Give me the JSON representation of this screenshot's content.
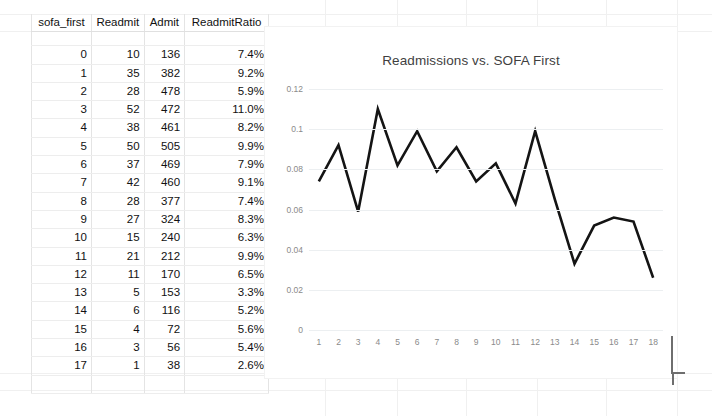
{
  "table": {
    "name": "readmissions-table",
    "columns": [
      "sofa_first",
      "Readmit",
      "Admit",
      "ReadmitRatio"
    ],
    "rows": [
      {
        "sofa_first": "0",
        "readmit": "10",
        "admit": "136",
        "ratio": "7.4%"
      },
      {
        "sofa_first": "1",
        "readmit": "35",
        "admit": "382",
        "ratio": "9.2%"
      },
      {
        "sofa_first": "2",
        "readmit": "28",
        "admit": "478",
        "ratio": "5.9%"
      },
      {
        "sofa_first": "3",
        "readmit": "52",
        "admit": "472",
        "ratio": "11.0%"
      },
      {
        "sofa_first": "4",
        "readmit": "38",
        "admit": "461",
        "ratio": "8.2%"
      },
      {
        "sofa_first": "5",
        "readmit": "50",
        "admit": "505",
        "ratio": "9.9%"
      },
      {
        "sofa_first": "6",
        "readmit": "37",
        "admit": "469",
        "ratio": "7.9%"
      },
      {
        "sofa_first": "7",
        "readmit": "42",
        "admit": "460",
        "ratio": "9.1%"
      },
      {
        "sofa_first": "8",
        "readmit": "28",
        "admit": "377",
        "ratio": "7.4%"
      },
      {
        "sofa_first": "9",
        "readmit": "27",
        "admit": "324",
        "ratio": "8.3%"
      },
      {
        "sofa_first": "10",
        "readmit": "15",
        "admit": "240",
        "ratio": "6.3%"
      },
      {
        "sofa_first": "11",
        "readmit": "21",
        "admit": "212",
        "ratio": "9.9%"
      },
      {
        "sofa_first": "12",
        "readmit": "11",
        "admit": "170",
        "ratio": "6.5%"
      },
      {
        "sofa_first": "13",
        "readmit": "5",
        "admit": "153",
        "ratio": "3.3%"
      },
      {
        "sofa_first": "14",
        "readmit": "6",
        "admit": "116",
        "ratio": "5.2%"
      },
      {
        "sofa_first": "15",
        "readmit": "4",
        "admit": "72",
        "ratio": "5.6%"
      },
      {
        "sofa_first": "16",
        "readmit": "3",
        "admit": "56",
        "ratio": "5.4%"
      },
      {
        "sofa_first": "17",
        "readmit": "1",
        "admit": "38",
        "ratio": "2.6%"
      }
    ]
  },
  "chart_data": {
    "type": "line",
    "title": "Readmissions vs. SOFA First",
    "xlabel": "",
    "ylabel": "",
    "x": [
      1,
      2,
      3,
      4,
      5,
      6,
      7,
      8,
      9,
      10,
      11,
      12,
      13,
      14,
      15,
      16,
      17,
      18
    ],
    "xticklabels": [
      "1",
      "2",
      "3",
      "4",
      "5",
      "6",
      "7",
      "8",
      "9",
      "10",
      "11",
      "12",
      "13",
      "14",
      "15",
      "16",
      "17",
      "18"
    ],
    "values": [
      0.074,
      0.092,
      0.059,
      0.11,
      0.082,
      0.099,
      0.079,
      0.091,
      0.074,
      0.083,
      0.063,
      0.099,
      0.065,
      0.033,
      0.052,
      0.056,
      0.054,
      0.026
    ],
    "yticks": [
      0,
      0.02,
      0.04,
      0.06,
      0.08,
      0.1,
      0.12
    ],
    "yticklabels": [
      "0",
      "0.02",
      "0.04",
      "0.06",
      "0.08",
      "0.1",
      "0.12"
    ],
    "ylim": [
      0,
      0.12
    ],
    "grid": true,
    "legend": false,
    "series_color": "#141414",
    "line_width": 2.6
  }
}
